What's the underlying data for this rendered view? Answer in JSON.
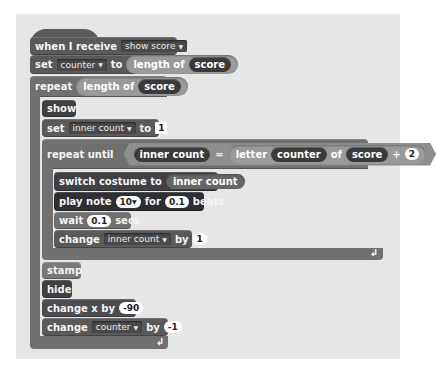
{
  "script": {
    "hat": {
      "label": "when I receive",
      "message": "show score"
    },
    "set_counter": {
      "label_set": "set",
      "variable": "counter",
      "label_to": "to",
      "reporter_label": "length of",
      "reporter_arg": "score"
    },
    "repeat": {
      "label": "repeat",
      "reporter_label": "length of",
      "reporter_arg": "score"
    },
    "show": {
      "label": "show"
    },
    "set_inner": {
      "label_set": "set",
      "variable": "inner count",
      "label_to": "to",
      "value": "1"
    },
    "repeat_until": {
      "label": "repeat until",
      "left": "inner count",
      "op": "=",
      "letter_label": "letter",
      "letter_index": "counter",
      "of_label": "of",
      "letter_source": "score",
      "plus": "+",
      "plus_value": "2"
    },
    "switch_costume": {
      "label": "switch costume to",
      "arg": "inner count"
    },
    "play_note": {
      "label_play": "play note",
      "note": "10",
      "label_for": "for",
      "beats": "0.1",
      "label_beats": "beats"
    },
    "wait": {
      "label_wait": "wait",
      "value": "0.1",
      "label_secs": "secs"
    },
    "change_inner": {
      "label": "change",
      "variable": "inner count",
      "label_by": "by",
      "value": "1"
    },
    "stamp": {
      "label": "stamp"
    },
    "hide": {
      "label": "hide"
    },
    "change_x": {
      "label": "change x by",
      "value": "-90"
    },
    "change_counter": {
      "label": "change",
      "variable": "counter",
      "label_by": "by",
      "value": "-1"
    },
    "loop_arrow": "↲"
  },
  "colors": {
    "canvas": "#e6e6e6",
    "control": "#707070",
    "looks": "#3f3f44",
    "sound": "#2e2e33",
    "data": "#5a5a5a",
    "pen": "#7a7a7a",
    "operator": "#8e8e8e"
  }
}
